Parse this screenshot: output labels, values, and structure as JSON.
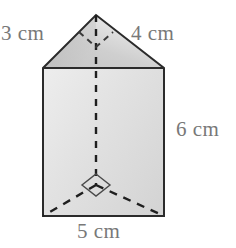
{
  "figure": {
    "name": "triangular-prism-diagram",
    "background_color": "#ffffff",
    "outline_color": "#2b2b2b",
    "hidden_edge_color": "#1f1f1f",
    "label_color": "#787878",
    "face_colors": {
      "triangle_top_light": "#efefef",
      "triangle_top_dark": "#b9b9b9",
      "rectangle_front_light": "#efefef",
      "rectangle_front_dark": "#d2d2d2"
    },
    "labels": [
      {
        "id": "label-3cm",
        "text": "3 cm",
        "edge": "left-slant-edge-of-top-triangle"
      },
      {
        "id": "label-4cm",
        "text": "4 cm",
        "edge": "right-slant-edge-of-top-triangle"
      },
      {
        "id": "label-6cm",
        "text": "6 cm",
        "edge": "vertical-height-of-prism"
      },
      {
        "id": "label-5cm",
        "text": "5 cm",
        "edge": "bottom-front-edge-width"
      }
    ],
    "markers": [
      {
        "id": "apex-right-angle",
        "type": "right-angle-square",
        "style": "dashed",
        "at": "apex"
      },
      {
        "id": "base-right-angle",
        "type": "right-angle-square",
        "style": "solid",
        "at": "hidden-back-vertex"
      }
    ],
    "vertices": {
      "apex": [
        96,
        15
      ],
      "top_left": [
        43,
        68
      ],
      "top_right": [
        164,
        68
      ],
      "bottom_left": [
        43,
        216
      ],
      "bottom_right": [
        164,
        216
      ],
      "hidden_back_vertex": [
        96,
        185
      ]
    }
  }
}
